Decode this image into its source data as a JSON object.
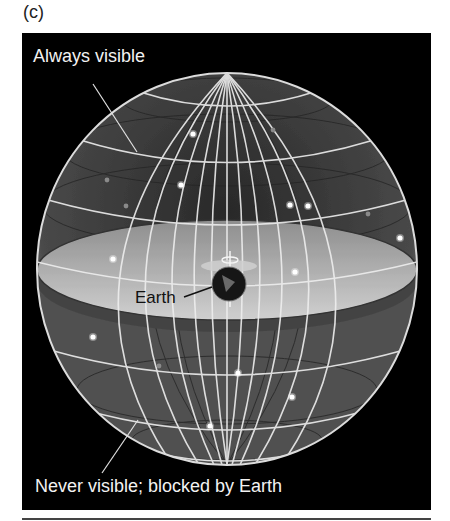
{
  "figure": {
    "panel_label": "(c)",
    "background_color": "#000000",
    "labels": {
      "always_visible": "Always visible",
      "earth": "Earth",
      "never_visible": "Never visible; blocked by Earth"
    },
    "icons": {
      "celestial_sphere": "celestial-sphere-icon",
      "earth": "earth-globe-icon",
      "horizon_plane": "horizon-plane-icon",
      "star": "star-icon"
    },
    "colors": {
      "sphere_upper": "#5a5a5a",
      "sphere_lower": "#555555",
      "horizon_disc": "#bdbdbd",
      "horizon_band": "#4a4a4a",
      "grid_line": "#f0f0f0",
      "earth": "#1a1a1a",
      "label_light": "#f2f2f2",
      "label_dark": "#111111"
    },
    "stars": [
      {
        "x": 193,
        "y": 134,
        "bright": true
      },
      {
        "x": 273,
        "y": 130,
        "bright": false
      },
      {
        "x": 181,
        "y": 185,
        "bright": true
      },
      {
        "x": 107,
        "y": 180,
        "bright": false
      },
      {
        "x": 126,
        "y": 206,
        "bright": false
      },
      {
        "x": 290,
        "y": 205,
        "bright": true
      },
      {
        "x": 308,
        "y": 206,
        "bright": true
      },
      {
        "x": 368,
        "y": 214,
        "bright": false
      },
      {
        "x": 400,
        "y": 238,
        "bright": true
      },
      {
        "x": 113,
        "y": 259,
        "bright": true
      },
      {
        "x": 295,
        "y": 272,
        "bright": true
      },
      {
        "x": 93,
        "y": 337,
        "bright": true
      },
      {
        "x": 159,
        "y": 366,
        "bright": false
      },
      {
        "x": 238,
        "y": 373,
        "bright": true
      },
      {
        "x": 292,
        "y": 397,
        "bright": true
      },
      {
        "x": 210,
        "y": 426,
        "bright": true
      }
    ]
  }
}
